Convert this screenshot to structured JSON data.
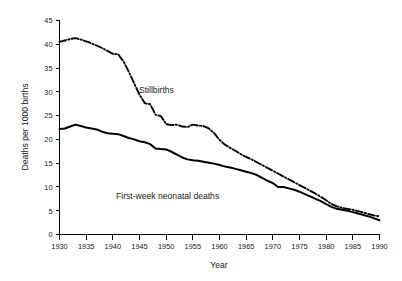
{
  "chart_data": {
    "type": "line",
    "title": "",
    "xlabel": "Year",
    "ylabel": "Deaths per 1000 births",
    "xlim": [
      1930,
      1990
    ],
    "ylim": [
      0,
      45
    ],
    "grid": false,
    "legend_position": "inline-annotation",
    "xticks": [
      1930,
      1935,
      1940,
      1945,
      1950,
      1955,
      1960,
      1965,
      1970,
      1975,
      1980,
      1985,
      1990
    ],
    "yticks": [
      0,
      5,
      10,
      15,
      20,
      25,
      30,
      35,
      40,
      45
    ],
    "x": [
      1930,
      1931,
      1932,
      1933,
      1934,
      1935,
      1936,
      1937,
      1938,
      1939,
      1940,
      1941,
      1942,
      1943,
      1944,
      1945,
      1946,
      1947,
      1948,
      1949,
      1950,
      1951,
      1952,
      1953,
      1954,
      1955,
      1956,
      1957,
      1958,
      1959,
      1960,
      1961,
      1962,
      1963,
      1964,
      1965,
      1966,
      1967,
      1968,
      1969,
      1970,
      1971,
      1972,
      1973,
      1974,
      1975,
      1976,
      1977,
      1978,
      1979,
      1980,
      1981,
      1982,
      1983,
      1984,
      1985,
      1986,
      1987,
      1988,
      1989,
      1990
    ],
    "series": [
      {
        "name": "Stillbirths",
        "style": "dash-dot",
        "values": [
          40.5,
          40.8,
          41.1,
          41.3,
          41.0,
          40.6,
          40.2,
          39.7,
          39.2,
          38.6,
          38.0,
          37.9,
          36.4,
          34.2,
          31.8,
          29.4,
          27.6,
          27.4,
          25.2,
          24.9,
          23.2,
          23.0,
          23.1,
          22.7,
          22.6,
          23.1,
          22.9,
          22.8,
          22.3,
          21.3,
          19.9,
          18.9,
          18.2,
          17.6,
          16.9,
          16.3,
          15.8,
          15.2,
          14.6,
          14.0,
          13.4,
          12.8,
          12.2,
          11.6,
          11.0,
          10.4,
          9.8,
          9.2,
          8.6,
          7.9,
          7.2,
          6.4,
          5.9,
          5.6,
          5.4,
          5.2,
          4.9,
          4.6,
          4.3,
          4.0,
          3.8
        ]
      },
      {
        "name": "First-week neonatal deaths",
        "style": "solid",
        "values": [
          22.2,
          22.3,
          22.7,
          23.1,
          22.8,
          22.5,
          22.3,
          22.1,
          21.6,
          21.3,
          21.2,
          21.1,
          20.7,
          20.3,
          20.0,
          19.6,
          19.4,
          19.0,
          18.1,
          18.0,
          17.9,
          17.4,
          16.8,
          16.2,
          15.8,
          15.6,
          15.5,
          15.3,
          15.1,
          14.9,
          14.6,
          14.3,
          14.1,
          13.8,
          13.5,
          13.2,
          12.9,
          12.5,
          11.9,
          11.3,
          10.8,
          10.0,
          10.0,
          9.7,
          9.4,
          9.0,
          8.5,
          8.0,
          7.5,
          7.0,
          6.4,
          5.8,
          5.4,
          5.2,
          5.0,
          4.7,
          4.4,
          4.1,
          3.8,
          3.4,
          3.0
        ]
      }
    ],
    "annotations": [
      {
        "text": "Stillbirths",
        "x_px": 139,
        "y_px": 93
      },
      {
        "text": "First-week neonatal deaths",
        "x_px": 116,
        "y_px": 199
      }
    ]
  }
}
